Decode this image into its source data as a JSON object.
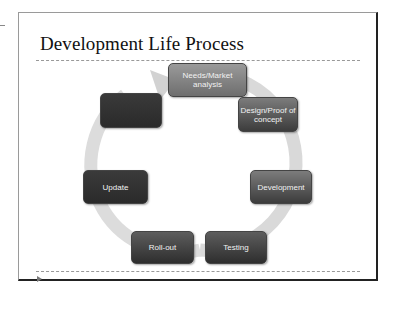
{
  "slide": {
    "title": "Development Life Process",
    "play_icon": "play-triangle-icon"
  },
  "cycle": {
    "arrow_color": "#d8d8d8",
    "steps": [
      {
        "label": "Needs/Market analysis"
      },
      {
        "label": "Design/Proof of concept"
      },
      {
        "label": "Development"
      },
      {
        "label": "Testing"
      },
      {
        "label": "Roll-out"
      },
      {
        "label": "Update"
      },
      {
        "label": ""
      }
    ]
  }
}
